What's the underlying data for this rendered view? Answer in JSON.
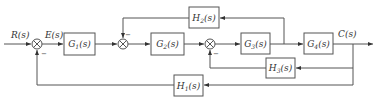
{
  "diagram": {
    "type": "control-system-block-diagram",
    "signals": {
      "input": "R(s)",
      "error": "E(s)",
      "output": "C(s)"
    },
    "blocks": [
      {
        "id": "G1",
        "label": "G",
        "sub": "1",
        "suffix": "(s)"
      },
      {
        "id": "G2",
        "label": "G",
        "sub": "2",
        "suffix": "(s)"
      },
      {
        "id": "G3",
        "label": "G",
        "sub": "3",
        "suffix": "(s)"
      },
      {
        "id": "G4",
        "label": "G",
        "sub": "4",
        "suffix": "(s)"
      },
      {
        "id": "H1",
        "label": "H",
        "sub": "1",
        "suffix": "(s)"
      },
      {
        "id": "H2",
        "label": "H",
        "sub": "2",
        "suffix": "(s)"
      },
      {
        "id": "H3",
        "label": "H",
        "sub": "3",
        "suffix": "(s)"
      }
    ],
    "summing_junctions": [
      {
        "id": "S1",
        "feedback_sign": "−"
      },
      {
        "id": "S2",
        "feedback_sign": "−"
      },
      {
        "id": "S3",
        "feedback_sign": "−"
      }
    ],
    "connections": [
      "R(s) → S1 → E(s) → G1 → S2 → G2 → S3 → G3 → G4 → C(s)",
      "G3 output → H2 → S2 (−)",
      "C(s) → H3 → S3 (−)",
      "C(s) → H1 → S1 (−)"
    ]
  }
}
